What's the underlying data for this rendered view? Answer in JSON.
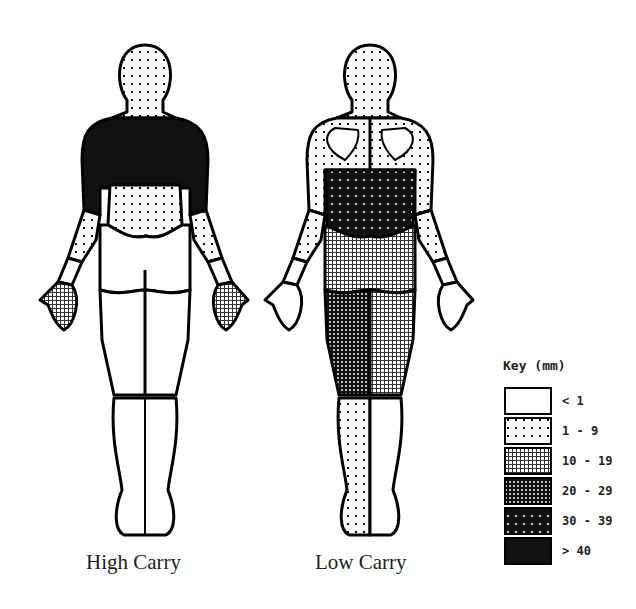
{
  "figures": [
    {
      "id": "high",
      "caption": "High Carry",
      "regions": {
        "head": "1-9",
        "upper_back": ">40",
        "lower_back": "1-9",
        "upper_arms": "1-9",
        "forearms": "<1",
        "hands": "10-19",
        "buttocks": "<1",
        "thighs": "<1",
        "lower_legs": "<1"
      }
    },
    {
      "id": "low",
      "caption": "Low Carry",
      "regions": {
        "head": "1-9",
        "upper_back": "1-9",
        "lower_back": "30-39",
        "upper_arms": "1-9",
        "forearms": "<1",
        "hands": "<1",
        "buttocks": "10-19",
        "left_thigh": "20-29",
        "right_thigh": "10-19",
        "left_lower_leg": "1-9",
        "right_lower_leg": "<1"
      }
    }
  ],
  "key": {
    "title": "Key (mm)",
    "items": [
      {
        "label": "< 1",
        "pattern": "white"
      },
      {
        "label": "1 - 9",
        "pattern": "sparse-dots"
      },
      {
        "label": "10 - 19",
        "pattern": "light-grid"
      },
      {
        "label": "20 - 29",
        "pattern": "dark-grid"
      },
      {
        "label": "30 - 39",
        "pattern": "dark-dots"
      },
      {
        "label": "> 40",
        "pattern": "solid-black"
      }
    ]
  }
}
